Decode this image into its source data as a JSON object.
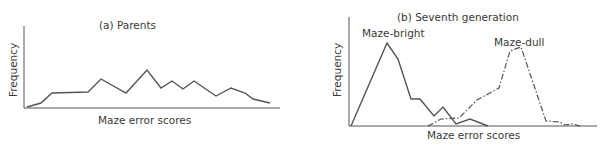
{
  "chart_data": [
    {
      "type": "line",
      "title": "(a)  Parents",
      "xlabel": "Maze error scores",
      "ylabel": "Frequency",
      "grid": false,
      "axis_ticks": false,
      "series": [
        {
          "name": "Parents",
          "style": "solid",
          "points": [
            [
              27,
              107
            ],
            [
              41,
              103
            ],
            [
              52,
              93
            ],
            [
              88,
              92
            ],
            [
              101,
              79
            ],
            [
              126,
              93
            ],
            [
              147,
              70
            ],
            [
              161,
              88
            ],
            [
              172,
              81
            ],
            [
              183,
              89
            ],
            [
              194,
              81
            ],
            [
              216,
              96
            ],
            [
              231,
              88
            ],
            [
              245,
              93
            ],
            [
              253,
              99
            ],
            [
              270,
              103
            ]
          ]
        }
      ]
    },
    {
      "type": "line",
      "title": "(b)  Seventh generation",
      "xlabel": "Maze error scores",
      "ylabel": "Frequency",
      "grid": false,
      "axis_ticks": false,
      "series": [
        {
          "name": "Maze-bright",
          "style": "solid",
          "points": [
            [
              351,
              126
            ],
            [
              387,
              43
            ],
            [
              398,
              59
            ],
            [
              411,
              99
            ],
            [
              420,
              99
            ],
            [
              434,
              116
            ],
            [
              443,
              107
            ],
            [
              456,
              124
            ],
            [
              470,
              119
            ],
            [
              488,
              126
            ]
          ]
        },
        {
          "name": "Maze-dull",
          "style": "dash-dot",
          "points": [
            [
              428,
              126
            ],
            [
              441,
              119
            ],
            [
              459,
              118
            ],
            [
              477,
              100
            ],
            [
              499,
              88
            ],
            [
              510,
              51
            ],
            [
              521,
              47
            ],
            [
              546,
              121
            ],
            [
              560,
              122
            ],
            [
              565,
              125
            ],
            [
              572,
              124
            ],
            [
              580,
              126
            ]
          ]
        }
      ]
    }
  ],
  "left": {
    "title": "(a)  Parents",
    "xlabel": "Maze error scores",
    "ylabel": "Frequency"
  },
  "right": {
    "title": "(b)  Seventh generation",
    "xlabel": "Maze error scores",
    "ylabel": "Frequency",
    "label_bright": "Maze-bright",
    "label_dull": "Maze-dull"
  }
}
